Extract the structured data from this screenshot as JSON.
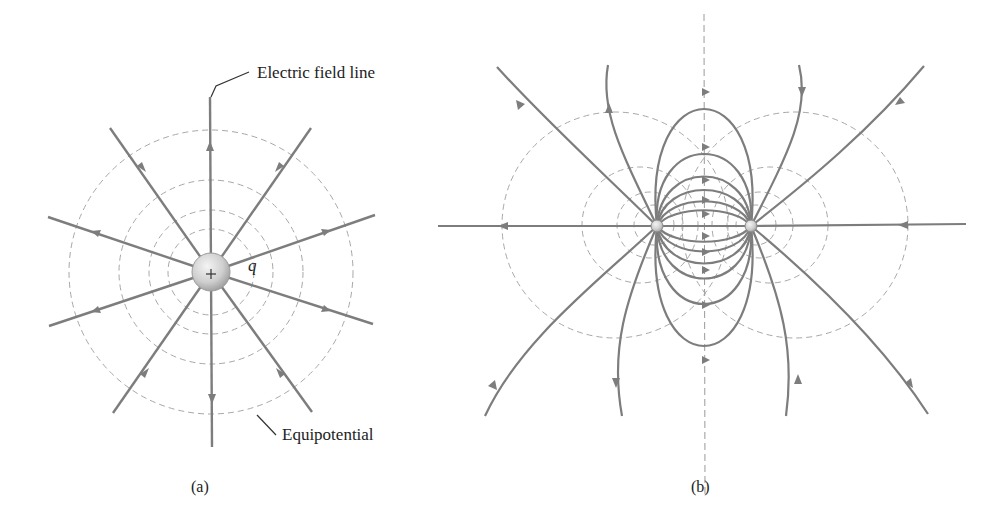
{
  "panel_a": {
    "caption": "(a)",
    "title": "Point charge field",
    "charge": {
      "sign": "+",
      "label": "q",
      "cx": 211,
      "cy": 272,
      "r": 18
    },
    "labels": {
      "field_line": "Electric field line",
      "equipotential": "Equipotential"
    },
    "equipotential_radii": [
      43,
      62,
      92,
      142
    ],
    "field_line_count": 10
  },
  "panel_b": {
    "caption": "(b)",
    "title": "Electric dipole field",
    "charges": [
      {
        "name": "left-charge",
        "cx": 657,
        "cy": 226
      },
      {
        "name": "right-charge",
        "cx": 751,
        "cy": 226
      }
    ],
    "symmetry_axis_x": 704
  },
  "colors": {
    "field_line": "#7d7d7d",
    "equipotential": "#a8a8a8",
    "charge_fill": "#c8c8c8",
    "text": "#222222"
  }
}
